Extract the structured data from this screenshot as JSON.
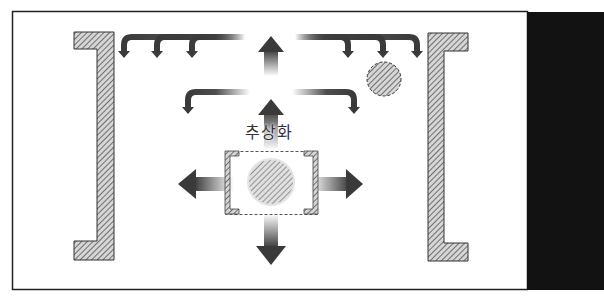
{
  "diagram": {
    "center_label": "추상화",
    "colors": {
      "frame_border": "#222222",
      "right_panel": "#111111",
      "hatch_fill": "#bdbdbd",
      "hatch_line": "#555555",
      "arrow_dark": "#3a3a3a"
    },
    "elements": [
      {
        "id": "left-bracket",
        "type": "hatched-bracket",
        "side": "left"
      },
      {
        "id": "right-bracket",
        "type": "hatched-bracket",
        "side": "right"
      },
      {
        "id": "center-box",
        "type": "dashed-box-with-hatched-corner-brackets"
      },
      {
        "id": "center-circle",
        "type": "hatched-circle",
        "position": "center"
      },
      {
        "id": "small-circle",
        "type": "hatched-circle-dashed",
        "position": "upper-right"
      },
      {
        "id": "up-arrow-top",
        "type": "arrow",
        "direction": "up"
      },
      {
        "id": "up-arrow-mid",
        "type": "arrow",
        "direction": "up"
      },
      {
        "id": "left-arrow",
        "type": "arrow",
        "direction": "left"
      },
      {
        "id": "right-arrow",
        "type": "arrow",
        "direction": "right"
      },
      {
        "id": "down-arrow",
        "type": "arrow",
        "direction": "down"
      },
      {
        "id": "curved-arrows-top-left",
        "type": "curved-arrow",
        "count": 3
      },
      {
        "id": "curved-arrows-top-right",
        "type": "curved-arrow",
        "count": 3
      },
      {
        "id": "curved-arrow-mid-left",
        "type": "curved-arrow",
        "count": 1
      },
      {
        "id": "curved-arrow-mid-right",
        "type": "curved-arrow",
        "count": 1
      }
    ]
  }
}
